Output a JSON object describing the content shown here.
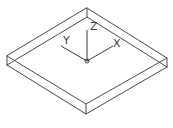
{
  "drawing": {
    "type": "isometric-wireframe-box",
    "colors": {
      "background": "#ffffff",
      "lines": "#4a4a4a"
    }
  },
  "ucs_icon": {
    "axes": [
      {
        "name": "X",
        "label": "X"
      },
      {
        "name": "Y",
        "label": "Y"
      },
      {
        "name": "Z",
        "label": "Z"
      }
    ]
  }
}
